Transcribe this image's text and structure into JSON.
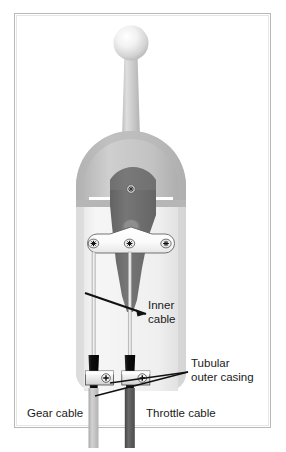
{
  "figure": {
    "frame": {
      "border_color": "#b5b5b5",
      "background": "#ffffff"
    },
    "caption": "",
    "labels": [
      {
        "id": "inner-cable",
        "lines": [
          "Inner",
          "cable"
        ],
        "line1": "Inner",
        "line2": "cable",
        "x": 148,
        "y": 305
      },
      {
        "id": "tubular-outer-casing",
        "lines": [
          "Tubular",
          "outer casing"
        ],
        "line1": "Tubular",
        "line2": "outer casing",
        "x": 191,
        "y": 363
      },
      {
        "id": "gear-cable",
        "lines": [
          "Gear cable"
        ],
        "line1": "Gear cable",
        "x": 27,
        "y": 414
      },
      {
        "id": "throttle-cable",
        "lines": [
          "Throttle cable"
        ],
        "line1": "Throttle cable",
        "x": 146,
        "y": 414
      }
    ],
    "parts": {
      "knob": {
        "name": "lever knob",
        "color": "#d8d8d8",
        "highlight": "#fdfdfd"
      },
      "lever_stem": {
        "name": "lever stem",
        "color": "#c4c4c4"
      },
      "housing_dome": {
        "name": "housing dome",
        "color": "#bcbcbc"
      },
      "housing_body": {
        "name": "housing body",
        "color": "#f0f0f0"
      },
      "lever_plate": {
        "name": "lever plate",
        "color": "#6e6e6e"
      },
      "pivot_screw": {
        "name": "pivot screw",
        "color": "#9a9a9a"
      },
      "mount_bracket": {
        "name": "mounting bracket",
        "color": "#fbfbfb"
      },
      "bracket_screws": {
        "name": "bracket screws",
        "count": 3,
        "color": "#e8e8e8"
      },
      "inner_cables": {
        "name": "inner cables",
        "count": 2,
        "color": "#e4e4e4"
      },
      "outer_casings": {
        "name": "tubular outer casings",
        "count": 2,
        "color": "#141414"
      },
      "clamp_blocks": {
        "name": "casing clamp blocks",
        "count": 2,
        "color": "#f4f4f4"
      },
      "clamp_screws": {
        "name": "clamp screws",
        "count": 2,
        "color": "#efefef"
      },
      "gear_cable": {
        "name": "gear cable",
        "color": "#bcbcbc"
      },
      "throttle_cable": {
        "name": "throttle cable",
        "color": "#5a5a5a"
      },
      "leader_lines": {
        "name": "leader lines",
        "count": 3,
        "color": "#111111"
      }
    }
  }
}
